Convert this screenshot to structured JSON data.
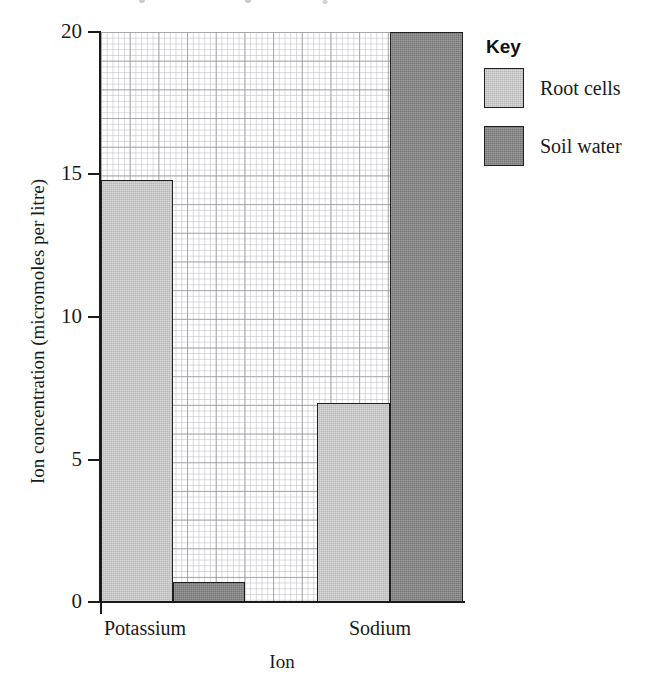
{
  "chart_data": {
    "type": "bar",
    "title": "",
    "xlabel": "Ion",
    "ylabel": "Ion concentration (micromoles per litre)",
    "categories": [
      "Potassium",
      "Sodium"
    ],
    "series": [
      {
        "name": "Root cells",
        "color": "#cbcbcb",
        "values": [
          14.8,
          7.0
        ]
      },
      {
        "name": "Soil water",
        "color": "#818181",
        "values": [
          0.7,
          20.0
        ]
      }
    ],
    "ylim": [
      0,
      20
    ],
    "xlim_note": "categorical",
    "yticks": [
      0,
      5,
      10,
      15,
      20
    ],
    "ytick_labels": [
      "0",
      "5",
      "10",
      "15",
      "20"
    ],
    "grid": "graph-paper minor and major gridlines",
    "legend_position": "right-top",
    "legend_title": "Key"
  },
  "axes": {
    "y_title": "Ion concentration (micromoles per litre)",
    "x_title": "Ion",
    "y_ticks": [
      {
        "label": "20",
        "value": 20
      },
      {
        "label": "15",
        "value": 15
      },
      {
        "label": "10",
        "value": 10
      },
      {
        "label": "5",
        "value": 5
      },
      {
        "label": "0",
        "value": 0
      }
    ],
    "x_ticks": [
      {
        "label": "Potassium"
      },
      {
        "label": "Sodium"
      }
    ]
  },
  "legend": {
    "title": "Key",
    "items": [
      {
        "label": "Root cells",
        "color": "#cbcbcb"
      },
      {
        "label": "Soil water",
        "color": "#818181"
      }
    ]
  },
  "bars": [
    {
      "name": "potassium-root-cells",
      "label": "Potassium Root cells",
      "value": 14.8,
      "style": "light"
    },
    {
      "name": "potassium-soil-water",
      "label": "Potassium Soil water",
      "value": 0.7,
      "style": "dark"
    },
    {
      "name": "sodium-root-cells",
      "label": "Sodium Root cells",
      "value": 7.0,
      "style": "light"
    },
    {
      "name": "sodium-soil-water",
      "label": "Sodium Soil water",
      "value": 20.0,
      "style": "dark"
    }
  ]
}
